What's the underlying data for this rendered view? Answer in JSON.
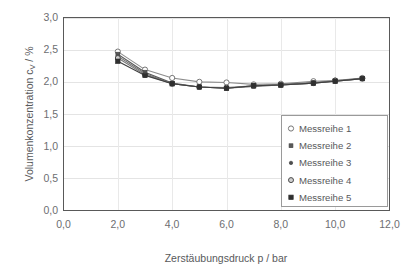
{
  "chart_data": {
    "type": "line",
    "title": "",
    "xlabel": "Zerstäubungsdruck p / bar",
    "ylabel": "Volumenkonzentration c_V / %",
    "ylabel_main": "Volumenkonzentration c",
    "ylabel_sub": "V",
    "ylabel_tail": " / %",
    "xlim": [
      0.0,
      12.0
    ],
    "ylim": [
      0.0,
      3.0
    ],
    "xticks": [
      0.0,
      2.0,
      4.0,
      6.0,
      8.0,
      10.0,
      12.0
    ],
    "yticks": [
      0.0,
      0.5,
      1.0,
      1.5,
      2.0,
      2.5,
      3.0
    ],
    "xtick_labels": [
      "0,0",
      "2,0",
      "4,0",
      "6,0",
      "8,0",
      "10,0",
      "12,0"
    ],
    "ytick_labels": [
      "0,0",
      "0,5",
      "1,0",
      "1,5",
      "2,0",
      "2,5",
      "3,0"
    ],
    "grid": {
      "horizontal": true,
      "vertical": true
    },
    "legend": {
      "position": "lower-right-inside",
      "entries": [
        "Messreihe 1",
        "Messreihe 2",
        "Messreihe 3",
        "Messreihe 4",
        "Messreihe 5"
      ]
    },
    "series": [
      {
        "name": "Messreihe 1",
        "marker": "open-circle",
        "color": "#8c8c8c",
        "x": [
          2.0,
          3.0,
          4.0,
          5.0,
          6.0,
          7.0,
          8.0,
          9.2,
          10.0,
          11.0
        ],
        "values": [
          2.47,
          2.19,
          2.06,
          2.0,
          1.99,
          1.96,
          1.97,
          2.01,
          2.02,
          2.06
        ]
      },
      {
        "name": "Messreihe 2",
        "marker": "filled-square-small",
        "color": "#595959",
        "x": [
          2.0,
          3.0,
          4.0,
          5.0,
          6.0,
          7.0,
          8.0,
          9.2,
          10.0,
          11.0
        ],
        "values": [
          2.43,
          2.15,
          1.98,
          1.92,
          1.9,
          1.93,
          1.95,
          1.98,
          2.01,
          2.05
        ]
      },
      {
        "name": "Messreihe 3",
        "marker": "filled-dot",
        "color": "#6e6e6e",
        "x": [
          2.0,
          3.0,
          4.0,
          5.0,
          6.0,
          7.0,
          8.0,
          9.2,
          10.0,
          11.0
        ],
        "values": [
          2.4,
          2.13,
          1.97,
          1.92,
          1.9,
          1.94,
          1.96,
          1.99,
          2.01,
          2.05
        ]
      },
      {
        "name": "Messreihe 4",
        "marker": "filled-circle",
        "color": "#7a7a7a",
        "x": [
          2.0,
          3.0,
          4.0,
          5.0,
          6.0,
          7.0,
          8.0,
          9.2,
          10.0,
          11.0
        ],
        "values": [
          2.37,
          2.11,
          1.97,
          1.92,
          1.91,
          1.94,
          1.95,
          1.98,
          2.02,
          2.05
        ]
      },
      {
        "name": "Messreihe 5",
        "marker": "filled-square",
        "color": "#3f3f3f",
        "x": [
          2.0,
          3.0,
          4.0,
          5.0,
          6.0,
          7.0,
          8.0,
          9.2,
          10.0,
          11.0
        ],
        "values": [
          2.32,
          2.1,
          1.97,
          1.92,
          1.9,
          1.94,
          1.95,
          1.98,
          2.01,
          2.05
        ]
      }
    ],
    "colors": {
      "grid": "#e4e4e4",
      "axis": "#595959",
      "text": "#58595b",
      "background": "#ffffff",
      "legend_border": "#9a9a9a"
    }
  }
}
